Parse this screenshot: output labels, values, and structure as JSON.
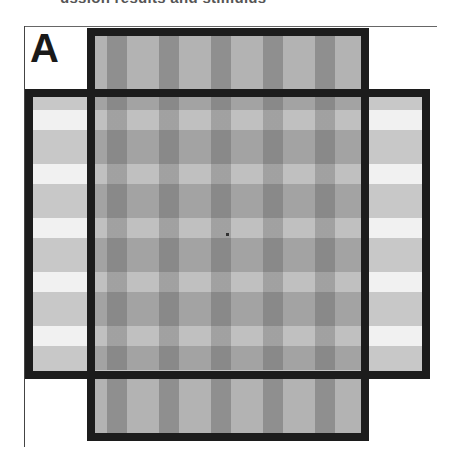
{
  "figure": {
    "caption_clipped": "ussion results and stimulus",
    "panel_label": "A",
    "panels": [
      {
        "name": "vertical-grating",
        "orientation": "vertical",
        "stripe_colors": [
          "#b3b3b3",
          "#8f8f8f"
        ]
      },
      {
        "name": "horizontal-grating",
        "orientation": "horizontal",
        "stripe_colors": [
          "#c8c8c8",
          "#f1f1f1"
        ]
      }
    ],
    "border_color": "#1c1c1c",
    "fixation_point": true
  }
}
